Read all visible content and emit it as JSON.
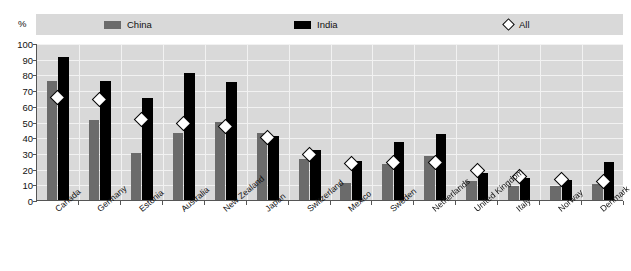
{
  "axis": {
    "unit_label": "%",
    "y_ticks": [
      0,
      10,
      20,
      30,
      40,
      50,
      60,
      70,
      80,
      90,
      100
    ]
  },
  "legend": {
    "items": [
      {
        "label": "China",
        "marker": "filled-square-grey",
        "color": "#6b6b6b"
      },
      {
        "label": "India",
        "marker": "filled-square-black",
        "color": "#000000"
      },
      {
        "label": "All",
        "marker": "open-diamond",
        "color": "#ffffff"
      }
    ]
  },
  "chart_data": {
    "type": "bar",
    "title": "",
    "subtitle": "",
    "xlabel": "",
    "ylabel": "%",
    "ylim": [
      0,
      100
    ],
    "grid": true,
    "legend_position": "top",
    "categories": [
      "Canada",
      "Germany",
      "Estonia",
      "Australia",
      "New Zealand",
      "Japan",
      "Switzerland",
      "Mexico",
      "Sweden",
      "Netherlands",
      "United Kingdom",
      "Italy",
      "Norway",
      "Denmark"
    ],
    "series": [
      {
        "name": "China",
        "type": "bar",
        "color": "#6b6b6b",
        "values": [
          76,
          51,
          30,
          43,
          50,
          43,
          26,
          11,
          23,
          28,
          12,
          9,
          9,
          10
        ]
      },
      {
        "name": "India",
        "type": "bar",
        "color": "#000000",
        "values": [
          91,
          76,
          65,
          81,
          75,
          41,
          32,
          25,
          37,
          42,
          17,
          14,
          13,
          24
        ]
      },
      {
        "name": "All",
        "type": "marker",
        "color": "#ffffff",
        "values": [
          65,
          64,
          51,
          49,
          47,
          40,
          29,
          23,
          24,
          24,
          19,
          15,
          13,
          12
        ]
      }
    ]
  }
}
